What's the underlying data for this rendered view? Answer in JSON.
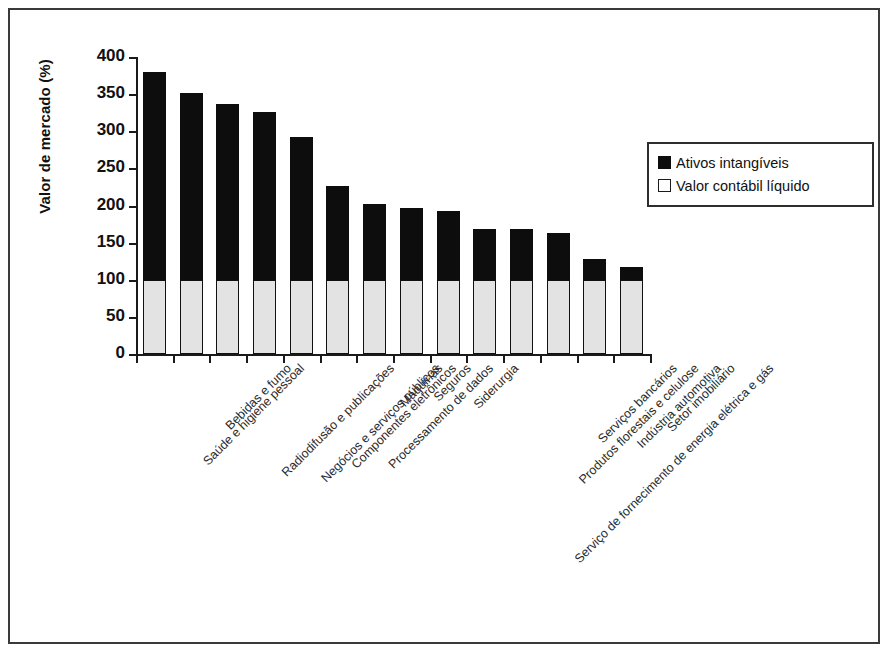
{
  "chart_data": {
    "type": "bar",
    "stacked": true,
    "title": "",
    "xlabel": "",
    "ylabel": "Valor de mercado (%)",
    "ylim": [
      0,
      400
    ],
    "ytick_step": 50,
    "yticks": [
      "400",
      "350",
      "300",
      "250",
      "200",
      "150",
      "100",
      "50",
      "0"
    ],
    "grid": false,
    "legend_position": "right",
    "categories": [
      "Saúde e higiene pessoal",
      "Bebidas e fumo",
      "Radiodifusão e publicações",
      "Negócios e serviços públicos",
      "Componentes eletrônicos",
      "Processamento de dados",
      "Máquinas",
      "Seguros",
      "Siderurgia",
      "Serviço de fornecimento de energia elétrica e gás",
      "Produtos florestais e celulose",
      "Serviços bancários",
      "Indústria automotiva",
      "Setor imobiliário"
    ],
    "series": [
      {
        "name": "Valor contábil líquido",
        "color": "#e3e3e3",
        "values": [
          100,
          100,
          100,
          100,
          100,
          100,
          100,
          100,
          100,
          100,
          100,
          100,
          100,
          100
        ]
      },
      {
        "name": "Ativos intangíveis",
        "color": "#0d0d0d",
        "values": [
          280,
          251,
          237,
          226,
          192,
          126,
          102,
          97,
          92,
          68,
          68,
          63,
          28,
          17
        ]
      }
    ],
    "totals": [
      380,
      351,
      337,
      326,
      292,
      226,
      202,
      197,
      192,
      168,
      168,
      163,
      128,
      117
    ]
  },
  "legend": {
    "items": [
      {
        "label": "Ativos intangíveis",
        "swatch": "filled-square-icon"
      },
      {
        "label": "Valor contábil líquido",
        "swatch": "hollow-square-icon"
      }
    ]
  }
}
